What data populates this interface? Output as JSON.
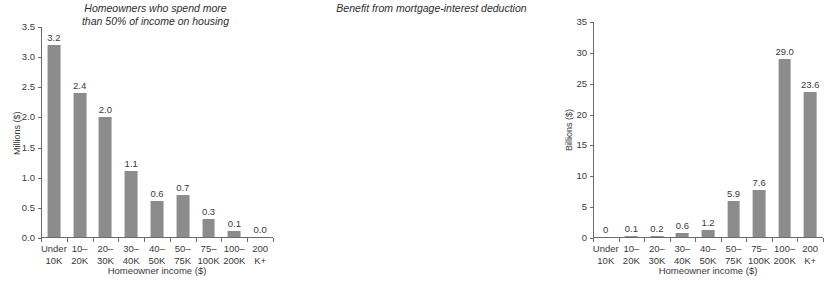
{
  "chart_data": [
    {
      "type": "bar",
      "title": "Homeowners who spend more\nthan 50% of income on housing",
      "xlabel": "Homeowner income ($)",
      "ylabel": "Millions ($)",
      "ylim": [
        0,
        3.5
      ],
      "yticks": [
        "0.0",
        "0.5",
        "1.0",
        "1.5",
        "2.0",
        "2.5",
        "3.0",
        "3.5"
      ],
      "ytick_values": [
        0,
        0.5,
        1.0,
        1.5,
        2.0,
        2.5,
        3.0,
        3.5
      ],
      "grid": false,
      "legend": "none",
      "categories": [
        "Under\n10K",
        "10–\n20K",
        "20–\n30K",
        "30–\n40K",
        "40–\n50K",
        "50–\n75K",
        "75–\n100K",
        "100–\n200K",
        "200\nK+"
      ],
      "values": [
        3.2,
        2.4,
        2.0,
        1.1,
        0.6,
        0.7,
        0.3,
        0.1,
        0.0
      ],
      "value_labels": [
        "3.2",
        "2.4",
        "2.0",
        "1.1",
        "0.6",
        "0.7",
        "0.3",
        "0.1",
        "0.0"
      ]
    },
    {
      "type": "bar",
      "title": "Benefit from mortgage-interest deduction",
      "xlabel": "Homeowner income ($)",
      "ylabel": "Billions ($)",
      "ylim": [
        0,
        35
      ],
      "yticks": [
        "0",
        "5",
        "10",
        "15",
        "20",
        "25",
        "30",
        "35"
      ],
      "ytick_values": [
        0,
        5,
        10,
        15,
        20,
        25,
        30,
        35
      ],
      "grid": false,
      "legend": "none",
      "categories": [
        "Under\n10K",
        "10–\n20K",
        "20–\n30K",
        "30–\n40K",
        "40–\n50K",
        "50–\n75K",
        "75–\n100K",
        "100–\n200K",
        "200\nK+"
      ],
      "values": [
        0,
        0.1,
        0.2,
        0.6,
        1.2,
        5.9,
        7.6,
        29.0,
        23.6
      ],
      "value_labels": [
        "0",
        "0.1",
        "0.2",
        "0.6",
        "1.2",
        "5.9",
        "7.6",
        "29.0",
        "23.6"
      ]
    }
  ],
  "colors": {
    "bar": "#8c8c8c",
    "axis": "#6b6b6b",
    "text": "#3a3a3a",
    "background": "#ffffff"
  }
}
